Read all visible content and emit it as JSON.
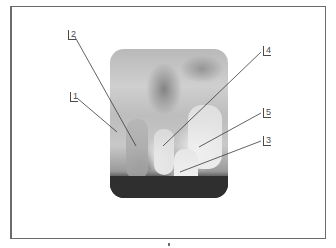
{
  "figure": {
    "type": "radiograph-with-callouts",
    "colors": {
      "frame": "#6b6b6b",
      "leader_lines": "#3a3a3a",
      "label_text": "#4a4a4a"
    }
  },
  "callouts": [
    {
      "id": "1",
      "label": "1",
      "label_pos": [
        70,
        92
      ],
      "target": [
        117,
        132
      ]
    },
    {
      "id": "2",
      "label": "2",
      "label_pos": [
        68,
        30
      ],
      "target": [
        136,
        146
      ]
    },
    {
      "id": "3",
      "label": "3",
      "label_pos": [
        263,
        136
      ],
      "target": [
        180,
        172
      ]
    },
    {
      "id": "4",
      "label": "4",
      "label_pos": [
        263,
        46
      ],
      "target": [
        163,
        146
      ]
    },
    {
      "id": "5",
      "label": "5",
      "label_pos": [
        263,
        108
      ],
      "target": [
        199,
        147
      ]
    }
  ]
}
